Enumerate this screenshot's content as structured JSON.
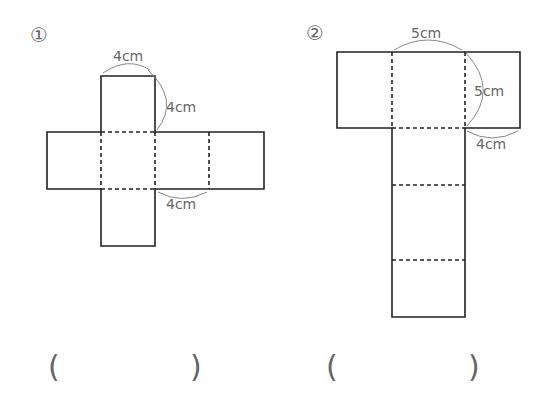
{
  "problems": [
    {
      "number": "①",
      "labels": {
        "top": "4cm",
        "side": "4cm",
        "bottom": "4cm"
      },
      "answer_open": "(",
      "answer_close": ")"
    },
    {
      "number": "②",
      "labels": {
        "top": "5cm",
        "side": "5cm",
        "bottom": "4cm"
      },
      "answer_open": "(",
      "answer_close": ")"
    }
  ],
  "colors": {
    "line": "#222222",
    "label": "#666666",
    "paren": "#777777"
  }
}
